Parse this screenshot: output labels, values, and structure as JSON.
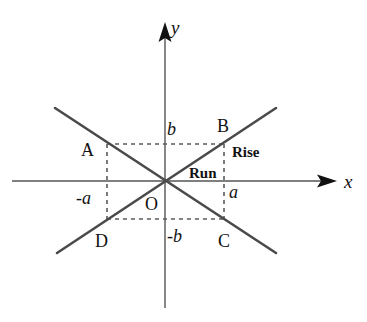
{
  "diagram": {
    "type": "coordinate-plane-slope",
    "axes": {
      "x_label": "x",
      "y_label": "y",
      "origin_label": "O"
    },
    "points": {
      "A": "A",
      "B": "B",
      "C": "C",
      "D": "D"
    },
    "tick_labels": {
      "b": "b",
      "neg_b": "-b",
      "a": "a",
      "neg_a": "-a"
    },
    "annotations": {
      "rise": "Rise",
      "run": "Run"
    },
    "lines": [
      {
        "name": "line-DB",
        "from": "D",
        "to": "B",
        "description": "positive slope through origin"
      },
      {
        "name": "line-AC",
        "from": "A",
        "to": "C",
        "description": "negative slope through origin"
      }
    ],
    "colors": {
      "line": "#4a4a4a",
      "axis": "#555555",
      "dash": "#5a5a5a",
      "text": "#111111",
      "background": "#ffffff"
    }
  }
}
